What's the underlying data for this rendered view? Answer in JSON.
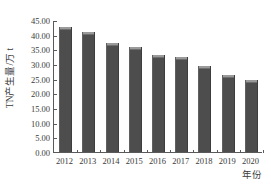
{
  "chart_data": {
    "type": "bar",
    "title": "",
    "xlabel": "年份",
    "ylabel": "TN产生量/万 t",
    "categories": [
      "2012",
      "2013",
      "2014",
      "2015",
      "2016",
      "2017",
      "2018",
      "2019",
      "2020"
    ],
    "values": [
      42.6,
      40.9,
      37.3,
      35.7,
      33.2,
      32.3,
      29.2,
      26.1,
      24.7
    ],
    "series": [
      {
        "name": "TN产生量",
        "values": [
          42.6,
          40.9,
          37.3,
          35.7,
          33.2,
          32.3,
          29.2,
          26.1,
          24.7
        ]
      }
    ],
    "ylim": [
      0,
      45
    ],
    "ytick_labels": [
      "45.00",
      "40.00",
      "35.00",
      "30.00",
      "25.00",
      "20.00",
      "15.00",
      "10.00",
      "5.00",
      "0.00"
    ],
    "ytick_values": [
      45,
      40,
      35,
      30,
      25,
      20,
      15,
      10,
      5,
      0
    ],
    "grid": false,
    "legend": null,
    "bar_color": "#4d4d4d",
    "bar_cap_color": "#9a9a9a",
    "axis_color": "#5a5a5a",
    "text_color": "#3a3a3a",
    "background": "#ffffff"
  }
}
